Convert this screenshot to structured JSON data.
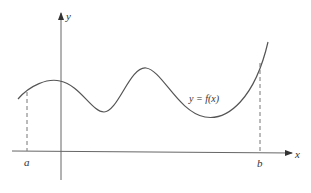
{
  "figure": {
    "type": "function-graph",
    "axes": {
      "x_label": "x",
      "y_label": "y"
    },
    "curve_label": "y = f(x)",
    "interval": {
      "left_label": "a",
      "right_label": "b"
    },
    "colors": {
      "stroke": "#555555",
      "text": "#333333",
      "background": "#ffffff"
    }
  }
}
